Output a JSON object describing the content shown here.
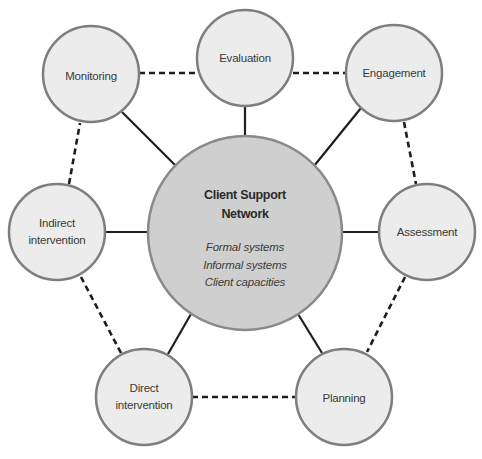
{
  "diagram": {
    "center": {
      "title_lines": [
        "Client Support",
        "Network"
      ],
      "items": [
        "Formal systems",
        "Informal systems",
        "Client capacities"
      ]
    },
    "nodes": [
      {
        "id": "evaluation",
        "lines": [
          "Evaluation"
        ]
      },
      {
        "id": "engagement",
        "lines": [
          "Engagement"
        ]
      },
      {
        "id": "assessment",
        "lines": [
          "Assessment"
        ]
      },
      {
        "id": "planning",
        "lines": [
          "Planning"
        ]
      },
      {
        "id": "direct-intervention",
        "lines": [
          "Direct",
          "intervention"
        ]
      },
      {
        "id": "indirect-intervention",
        "lines": [
          "Indirect",
          "intervention"
        ]
      },
      {
        "id": "monitoring",
        "lines": [
          "Monitoring"
        ]
      }
    ],
    "solid_links": [
      "center-evaluation",
      "center-engagement",
      "center-assessment",
      "center-planning",
      "center-direct-intervention",
      "center-indirect-intervention",
      "center-monitoring"
    ],
    "dashed_links": [
      "monitoring-evaluation",
      "evaluation-engagement",
      "engagement-assessment",
      "assessment-planning",
      "planning-direct-intervention",
      "direct-intervention-indirect-intervention",
      "indirect-intervention-monitoring"
    ],
    "colors": {
      "outer_fill": "#ececec",
      "outer_stroke": "#7e7e7e",
      "center_fill": "#cfcfcf",
      "center_stroke": "#8a8a8a",
      "link": "#1e1e1e",
      "text": "#3a3a3a"
    }
  }
}
